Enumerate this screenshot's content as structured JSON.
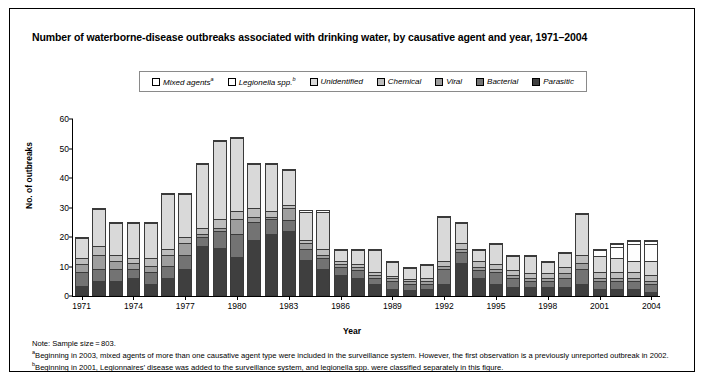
{
  "title": "Number of waterborne-disease outbreaks associated with drinking water, by causative agent and year, 1971–2004",
  "legend": {
    "items": [
      {
        "label": "Mixed agents",
        "sup": "a",
        "color": "#ffffff"
      },
      {
        "label": "Legionella spp.",
        "sup": "b",
        "color": "#fefefe"
      },
      {
        "label": "Unidentified",
        "sup": "",
        "color": "#d9d9d9"
      },
      {
        "label": "Chemical",
        "sup": "",
        "color": "#bdbdbd"
      },
      {
        "label": "Viral",
        "sup": "",
        "color": "#9e9e9e"
      },
      {
        "label": "Bacterial",
        "sup": "",
        "color": "#737373"
      },
      {
        "label": "Parasitic",
        "sup": "",
        "color": "#3f3f3f"
      }
    ]
  },
  "axes": {
    "y_label": "No. of outbreaks",
    "x_label": "Year",
    "y_ticks": [
      0,
      10,
      20,
      30,
      40,
      50,
      60
    ],
    "x_ticks": [
      "1971",
      "1974",
      "1977",
      "1980",
      "1983",
      "1986",
      "1989",
      "1992",
      "1995",
      "1998",
      "2001",
      "2004"
    ]
  },
  "notes": {
    "note": "Note: Sample size = 803.",
    "footnote_a_sup": "a",
    "footnote_a": "Beginning in 2003, mixed agents of more than one causative agent type were included in the surveillance system. However, the first observation is a previously unreported outbreak in 2002.",
    "footnote_b_sup": "b",
    "footnote_b": "Beginning in 2001, Legionnaires’ disease was added to the surveillance system, and legionella spp. were classified separately in this figure."
  },
  "chart_data": {
    "type": "bar",
    "subtype": "stacked",
    "title": "Number of waterborne-disease outbreaks associated with drinking water, by causative agent and year, 1971–2004",
    "xlabel": "Year",
    "ylabel": "No. of outbreaks",
    "ylim": [
      0,
      60
    ],
    "ytick_step": 10,
    "grid": false,
    "legend_position": "top",
    "sample_size": 803,
    "categories": [
      "1971",
      "1972",
      "1973",
      "1974",
      "1975",
      "1976",
      "1977",
      "1978",
      "1979",
      "1980",
      "1981",
      "1982",
      "1983",
      "1984",
      "1985",
      "1986",
      "1987",
      "1988",
      "1989",
      "1990",
      "1991",
      "1992",
      "1993",
      "1994",
      "1995",
      "1996",
      "1997",
      "1998",
      "1999",
      "2000",
      "2001",
      "2002",
      "2003",
      "2004"
    ],
    "series": [
      {
        "name": "Parasitic",
        "color": "#3f3f3f",
        "values": [
          3,
          5,
          5,
          6,
          4,
          6,
          9,
          17,
          16,
          13,
          19,
          21,
          22,
          12,
          9,
          7,
          6,
          4,
          2,
          2,
          2,
          4,
          11,
          6,
          4,
          3,
          3,
          3,
          3,
          4,
          2,
          2,
          2,
          1
        ]
      },
      {
        "name": "Bacterial",
        "color": "#737373",
        "values": [
          5,
          4,
          4,
          3,
          4,
          4,
          5,
          3,
          6,
          8,
          6,
          5,
          4,
          4,
          4,
          3,
          3,
          2,
          3,
          2,
          2,
          5,
          4,
          3,
          4,
          3,
          2,
          2,
          3,
          5,
          3,
          3,
          3,
          3
        ]
      },
      {
        "name": "Viral",
        "color": "#9e9e9e",
        "values": [
          3,
          5,
          3,
          2,
          2,
          4,
          4,
          1,
          1,
          5,
          2,
          1,
          4,
          2,
          1,
          1,
          1,
          1,
          1,
          1,
          1,
          1,
          1,
          1,
          1,
          1,
          1,
          1,
          2,
          2,
          1,
          1,
          1,
          1
        ]
      },
      {
        "name": "Chemical",
        "color": "#bdbdbd",
        "values": [
          2,
          3,
          2,
          2,
          3,
          2,
          2,
          2,
          3,
          3,
          3,
          2,
          1,
          1,
          2,
          1,
          1,
          1,
          1,
          1,
          1,
          2,
          2,
          2,
          2,
          2,
          2,
          2,
          2,
          3,
          2,
          2,
          2,
          2
        ]
      },
      {
        "name": "Unidentified",
        "color": "#d9d9d9",
        "values": [
          7,
          13,
          11,
          12,
          12,
          19,
          15,
          22,
          27,
          25,
          15,
          16,
          12,
          10,
          13,
          4,
          5,
          8,
          5,
          4,
          5,
          15,
          7,
          4,
          7,
          5,
          6,
          4,
          5,
          14,
          6,
          5,
          4,
          5
        ]
      },
      {
        "name": "Legionella spp.",
        "color": "#fefefe",
        "values": [
          0,
          0,
          0,
          0,
          0,
          0,
          0,
          0,
          0,
          0,
          0,
          0,
          0,
          0,
          0,
          0,
          0,
          0,
          0,
          0,
          0,
          0,
          0,
          0,
          0,
          0,
          0,
          0,
          0,
          0,
          2,
          4,
          6,
          6
        ]
      },
      {
        "name": "Mixed agents",
        "color": "#ffffff",
        "values": [
          0,
          0,
          0,
          0,
          0,
          0,
          0,
          0,
          0,
          0,
          0,
          0,
          0,
          0,
          0,
          0,
          0,
          0,
          0,
          0,
          0,
          0,
          0,
          0,
          0,
          0,
          0,
          0,
          0,
          0,
          0,
          1,
          1,
          1
        ]
      }
    ],
    "totals": [
      20,
      30,
      25,
      25,
      25,
      35,
      35,
      45,
      53,
      54,
      45,
      45,
      43,
      29,
      29,
      16,
      16,
      16,
      12,
      10,
      11,
      27,
      25,
      16,
      18,
      14,
      14,
      12,
      15,
      28,
      16,
      18,
      19,
      19
    ]
  }
}
